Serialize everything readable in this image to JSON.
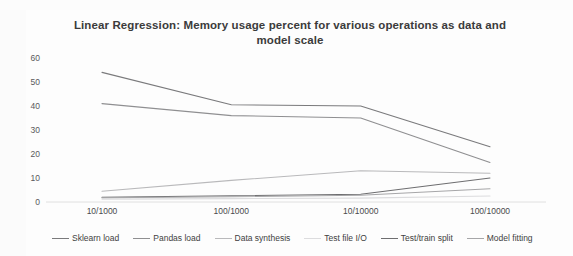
{
  "chart_data": {
    "type": "line",
    "title": "Linear Regression: Memory usage percent for various operations as data and model scale",
    "xlabel": "",
    "ylabel": "",
    "categories": [
      "10/1000",
      "100/1000",
      "10/10000",
      "100/10000"
    ],
    "yticks": [
      0,
      10,
      20,
      30,
      40,
      50,
      60
    ],
    "ylim": [
      0,
      60
    ],
    "grid": false,
    "legend_position": "bottom",
    "series": [
      {
        "name": "Sklearn load",
        "values": [
          54.0,
          40.5,
          40.0,
          23.0
        ],
        "color": "#7a7a7c"
      },
      {
        "name": "Pandas load",
        "values": [
          41.0,
          36.0,
          35.0,
          16.5
        ],
        "color": "#8f8f91"
      },
      {
        "name": "Data synthesis",
        "values": [
          4.5,
          9.0,
          13.0,
          12.0
        ],
        "color": "#b9b9bb"
      },
      {
        "name": "Test file I/O",
        "values": [
          1.2,
          1.4,
          1.6,
          2.5
        ],
        "color": "#dcdcde"
      },
      {
        "name": "Test/train split",
        "values": [
          2.0,
          2.6,
          3.2,
          10.0
        ],
        "color": "#6e6e70"
      },
      {
        "name": "Model fitting",
        "values": [
          1.8,
          2.2,
          2.8,
          5.5
        ],
        "color": "#a6a6a8"
      }
    ]
  }
}
